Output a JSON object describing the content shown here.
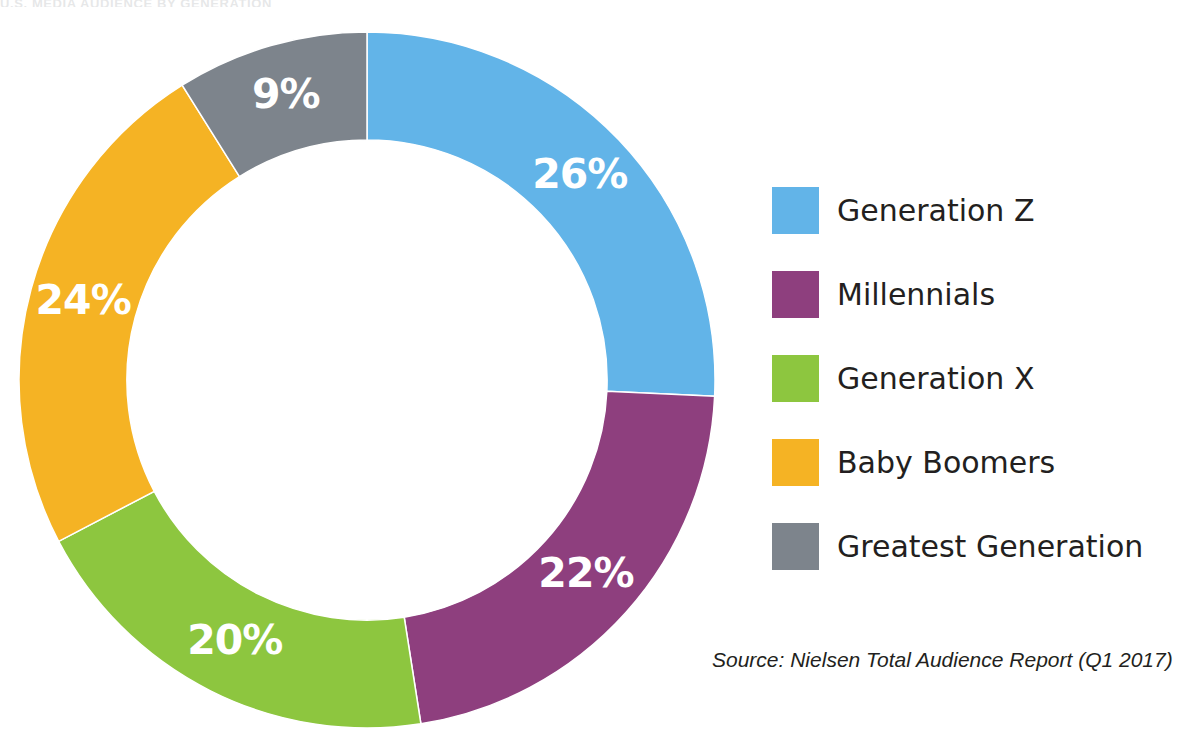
{
  "figure": {
    "top_clipped_text": "U.S. MEDIA AUDIENCE BY GENERATION",
    "background_color": "#ffffff"
  },
  "source": {
    "text": "Source: Nielsen Total Audience Report (Q1 2017)"
  },
  "legend": {
    "position": "right",
    "items": [
      {
        "label": "Generation Z",
        "color": "#62b4e8"
      },
      {
        "label": "Millennials",
        "color": "#8e3f7e"
      },
      {
        "label": "Generation X",
        "color": "#8dc63f"
      },
      {
        "label": "Baby Boomers",
        "color": "#f5b324"
      },
      {
        "label": "Greatest Generation",
        "color": "#7d848c"
      }
    ]
  },
  "chart_data": {
    "type": "pie",
    "variant": "donut",
    "title": "",
    "unit": "percent",
    "total": 101,
    "start_angle_deg": 0,
    "direction": "clockwise",
    "inner_radius_ratio": 0.69,
    "categories": [
      "Generation Z",
      "Millennials",
      "Generation X",
      "Baby Boomers",
      "Greatest Generation"
    ],
    "values": [
      26,
      22,
      20,
      24,
      9
    ],
    "colors": [
      "#62b4e8",
      "#8e3f7e",
      "#8dc63f",
      "#f5b324",
      "#7d848c"
    ],
    "data_labels": [
      "26%",
      "22%",
      "20%",
      "24%",
      "9%"
    ],
    "data_label_color": "#ffffff",
    "slices": [
      {
        "name": "Generation Z",
        "value": 26,
        "label": "26%",
        "color": "#62b4e8"
      },
      {
        "name": "Millennials",
        "value": 22,
        "label": "22%",
        "color": "#8e3f7e"
      },
      {
        "name": "Generation X",
        "value": 20,
        "label": "20%",
        "color": "#8dc63f"
      },
      {
        "name": "Baby Boomers",
        "value": 24,
        "label": "24%",
        "color": "#f5b324"
      },
      {
        "name": "Greatest Generation",
        "value": 9,
        "label": "9%",
        "color": "#7d848c"
      }
    ],
    "legend": [
      "Generation Z",
      "Millennials",
      "Generation X",
      "Baby Boomers",
      "Greatest Generation"
    ],
    "grid": false,
    "legend_position": "right"
  }
}
